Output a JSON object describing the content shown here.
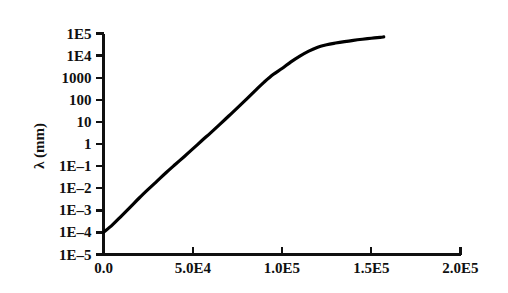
{
  "chart_data": {
    "type": "line",
    "title": "",
    "subtitle": "",
    "xlabel": "",
    "ylabel": "λ (mm)",
    "yscale": "log",
    "xscale": "linear",
    "grid": false,
    "legend": null,
    "xlim": [
      0,
      200000
    ],
    "ylim": [
      1e-05,
      100000
    ],
    "xticks": [
      0,
      50000,
      100000,
      150000,
      200000
    ],
    "xtick_labels": [
      "0.0",
      "5.0E4",
      "1.0E5",
      "1.5E5",
      "2.0E5"
    ],
    "yticks": [
      100000,
      10000,
      1000,
      100,
      10,
      1,
      0.1,
      0.01,
      0.001,
      0.0001,
      1e-05
    ],
    "ytick_labels": [
      "1E5",
      "1E4",
      "1000",
      "100",
      "10",
      "1",
      "1E–1",
      "1E–2",
      "1E–3",
      "1E–4",
      "1E–5"
    ],
    "series": [
      {
        "name": "lambda",
        "color": "#000000",
        "line_width": 3.2,
        "x": [
          0,
          5000,
          10000,
          15000,
          20000,
          25000,
          30000,
          35000,
          40000,
          45000,
          50000,
          55000,
          60000,
          65000,
          70000,
          75000,
          80000,
          85000,
          90000,
          95000,
          100000,
          105000,
          110000,
          115000,
          120000,
          125000,
          130000,
          135000,
          140000,
          145000,
          150000,
          155000,
          157000
        ],
        "y": [
          0.0001,
          0.00022,
          0.00055,
          0.0014,
          0.0036,
          0.0088,
          0.021,
          0.05,
          0.115,
          0.26,
          0.6,
          1.4,
          3.2,
          7.5,
          18,
          43,
          105,
          260,
          630,
          1400,
          2600,
          5200,
          9500,
          16000,
          24000,
          31000,
          37000,
          43000,
          49000,
          55000,
          61000,
          67000,
          70000
        ]
      }
    ]
  },
  "axes": {
    "tick_color": "#101010",
    "axis_color": "#101010",
    "background": "#ffffff"
  }
}
